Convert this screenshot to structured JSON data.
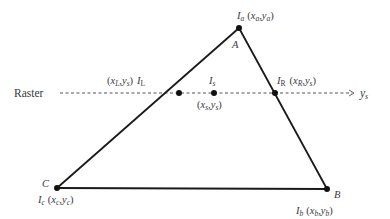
{
  "diagram": {
    "raster_label": "Raster",
    "raster_y_label": "y",
    "raster_y_sub": "s",
    "colors": {
      "line": "#1a1a1a",
      "text": "#3a3a3a",
      "dash": "#555555",
      "background": "#ffffff"
    },
    "vertices": {
      "A": {
        "name": "A",
        "label_I": "I",
        "label_I_sub": "a",
        "coord_x": "x",
        "coord_x_sub": "a",
        "coord_y": "y",
        "coord_y_sub": "a",
        "px": 239,
        "py": 28
      },
      "B": {
        "name": "B",
        "label_I": "I",
        "label_I_sub": "b",
        "coord_x": "x",
        "coord_x_sub": "b",
        "coord_y": "y",
        "coord_y_sub": "b",
        "px": 327,
        "py": 189
      },
      "C": {
        "name": "C",
        "label_I": "I",
        "label_I_sub": "c",
        "coord_x": "x",
        "coord_x_sub": "c",
        "coord_y": "y",
        "coord_y_sub": "c",
        "px": 57,
        "py": 188
      }
    },
    "scan_points": {
      "L": {
        "label_I": "I",
        "label_I_sub": "L",
        "coord_x": "x",
        "coord_x_sub": "L",
        "coord_y": "y",
        "coord_y_sub": "s",
        "px": 179,
        "py": 93
      },
      "S": {
        "label_I": "I",
        "label_I_sub": "s",
        "coord_x": "x",
        "coord_x_sub": "s",
        "coord_y": "y",
        "coord_y_sub": "s",
        "px": 214,
        "py": 93
      },
      "R": {
        "label_I": "I",
        "label_I_sub": "R",
        "coord_x": "x",
        "coord_x_sub": "R",
        "coord_y": "y",
        "coord_y_sub": "s",
        "px": 275,
        "py": 93
      }
    },
    "punct": {
      "open": "(",
      "close": ")",
      "comma": ","
    }
  }
}
